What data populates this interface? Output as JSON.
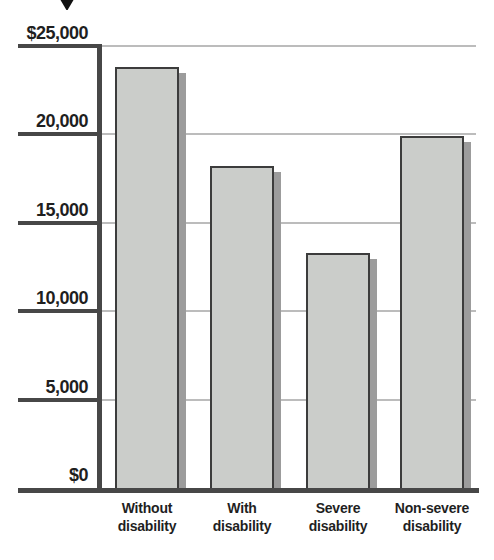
{
  "chart_data": {
    "type": "bar",
    "title": "",
    "xlabel": "",
    "ylabel": "",
    "categories": [
      "Without disability",
      "With disability",
      "Severe disability",
      "Non-severe disability"
    ],
    "category_label_lines": [
      "Without\ndisability",
      "With\ndisability",
      "Severe\ndisability",
      "Non-severe\ndisability"
    ],
    "values": [
      23800,
      18200,
      13300,
      19900
    ],
    "ylim": [
      0,
      25000
    ],
    "y_ticks": [
      {
        "value": 25000,
        "label": "$25,000"
      },
      {
        "value": 20000,
        "label": "20,000"
      },
      {
        "value": 15000,
        "label": "15,000"
      },
      {
        "value": 10000,
        "label": "10,000"
      },
      {
        "value": 5000,
        "label": "5,000"
      },
      {
        "value": 0,
        "label": "$0"
      }
    ],
    "grid": true,
    "legend": false,
    "colors": {
      "bar_fill": "#cbcdca",
      "bar_border": "#3c3c3c",
      "bar_shadow": "#9c9c9c",
      "axis": "#474747",
      "gridline": "#bcbcbc",
      "text": "#1f1f1f",
      "arrow": "#111111"
    }
  },
  "decorations": {
    "top_arrow_icon": "down-arrow"
  }
}
